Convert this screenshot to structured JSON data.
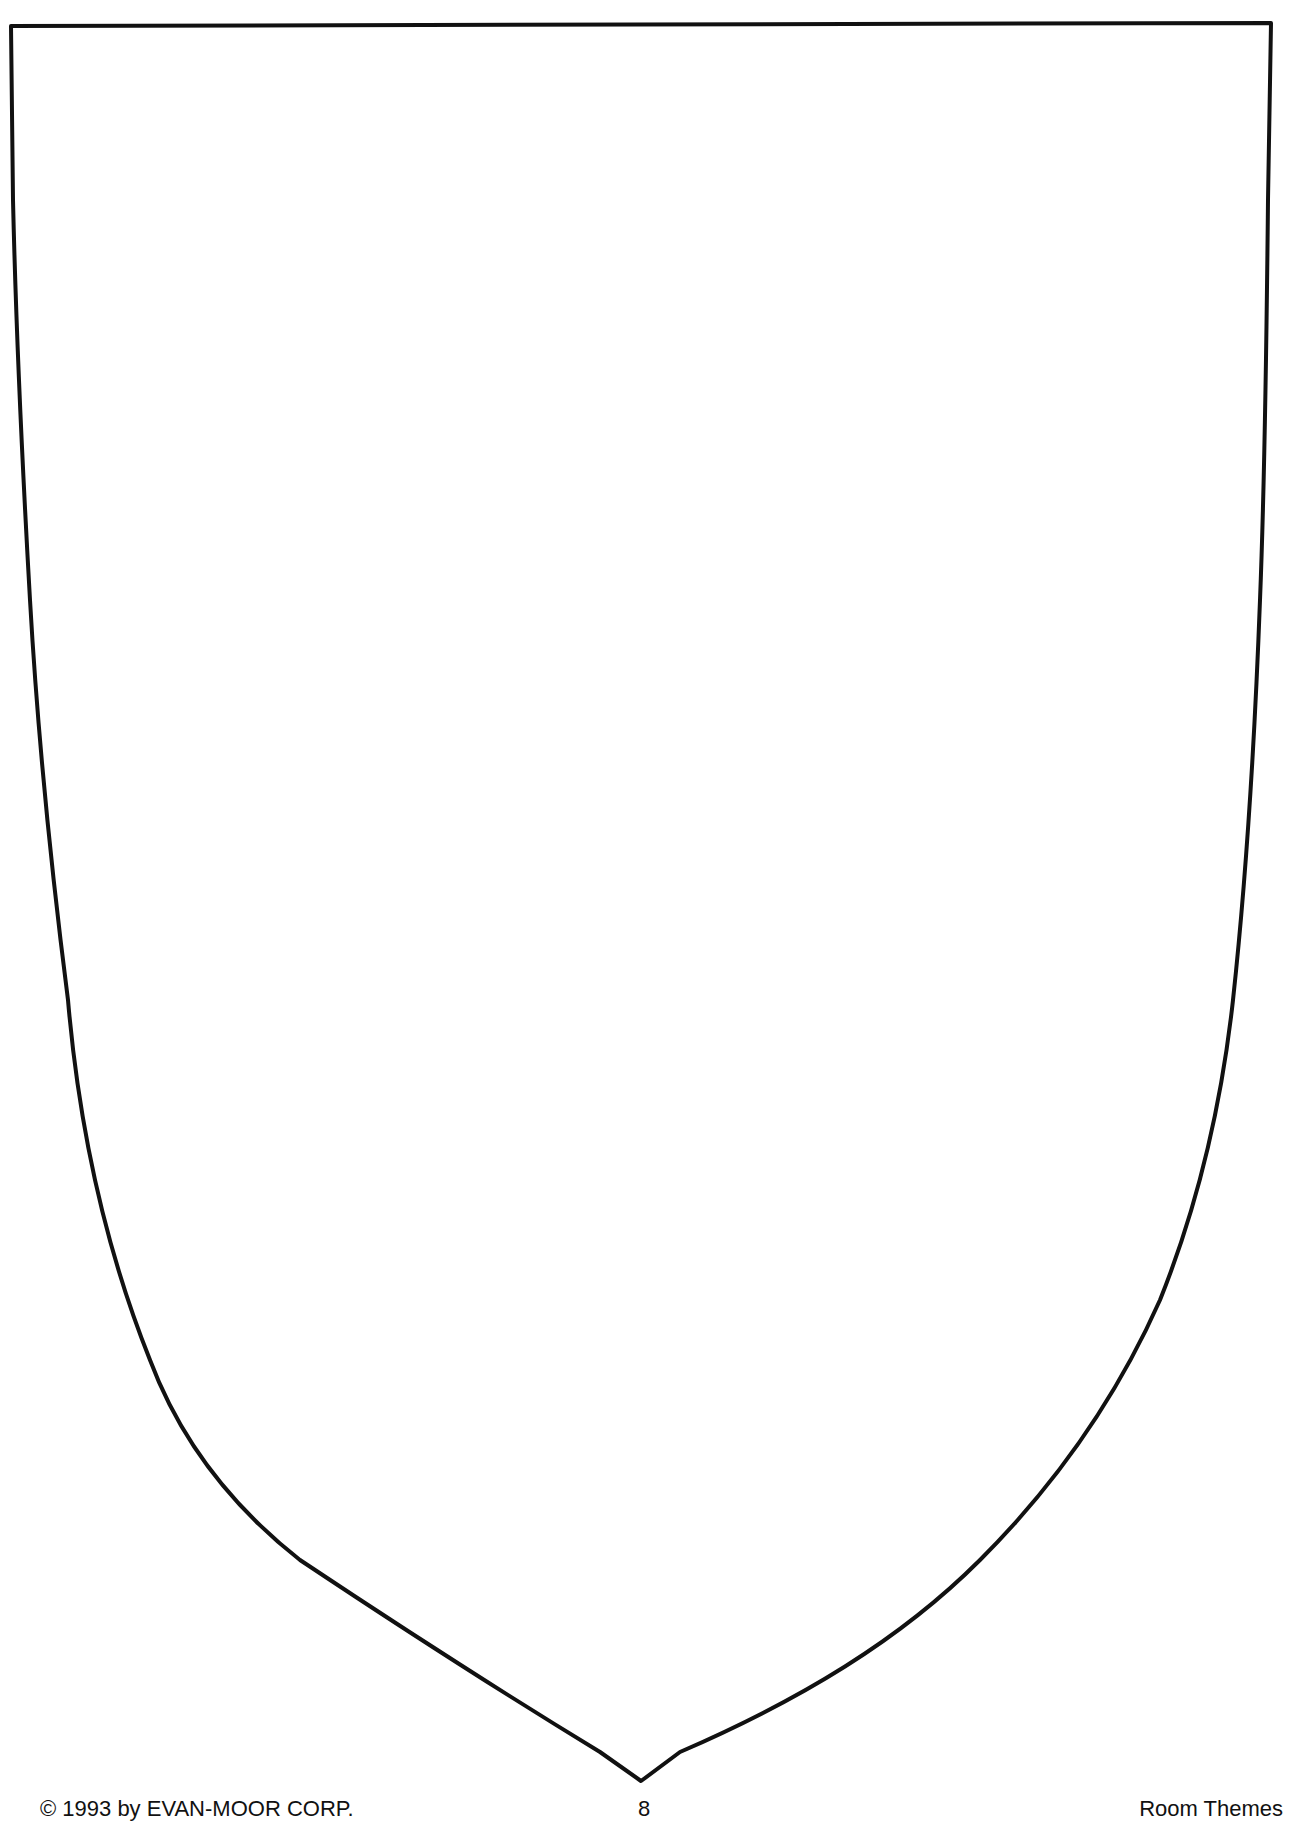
{
  "worksheet": {
    "shape": "blank-shield-outline",
    "outline_color": "#111111",
    "background_color": "#ffffff"
  },
  "footer": {
    "copyright": "© 1993 by EVAN-MOOR CORP.",
    "page_number": "8",
    "book_title": "Room Themes"
  }
}
